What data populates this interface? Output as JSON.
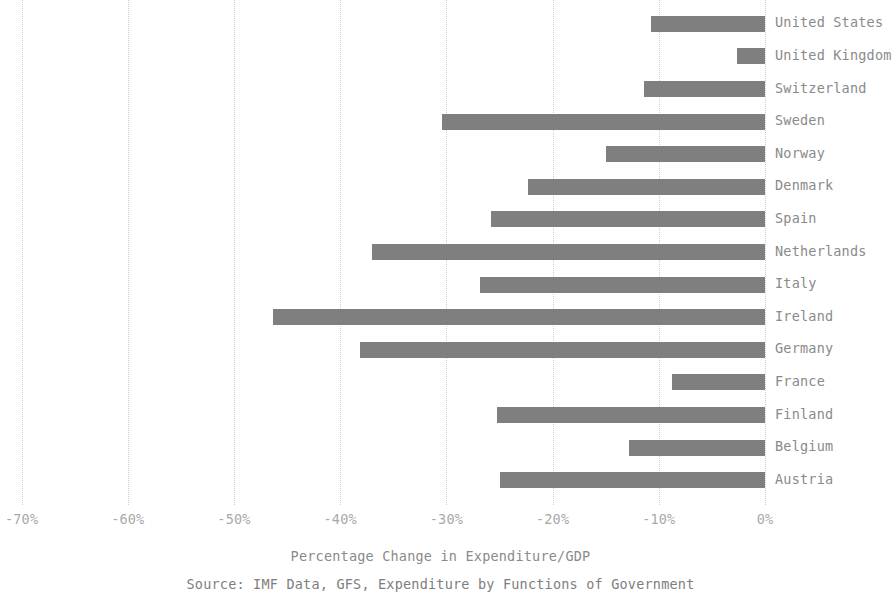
{
  "chart_data": {
    "type": "bar",
    "orientation": "horizontal",
    "title": "",
    "xlabel": "Percentage Change in Expenditure/GDP",
    "ylabel": "",
    "source": "Source: IMF Data, GFS, Expenditure by Functions of Government",
    "xlim": [
      -75,
      2
    ],
    "xticks": [
      -70,
      -60,
      -50,
      -40,
      -30,
      -20,
      -10,
      0
    ],
    "xticklabels": [
      "-70%",
      "-60%",
      "-50%",
      "-40%",
      "-30%",
      "-20%",
      "-10%",
      "0%"
    ],
    "grid": "vertical-dotted",
    "legend": "none",
    "bar_color": "#7f7f7f",
    "categories": [
      "United States",
      "United Kingdom",
      "Switzerland",
      "Sweden",
      "Norway",
      "Denmark",
      "Spain",
      "Netherlands",
      "Italy",
      "Ireland",
      "Germany",
      "France",
      "Finland",
      "Belgium",
      "Austria"
    ],
    "values": [
      -10.7,
      -2.6,
      -11.4,
      -30.4,
      -15.0,
      -22.3,
      -25.8,
      -37.0,
      -26.8,
      -46.3,
      -38.1,
      -8.8,
      -25.2,
      -12.8,
      -25.0
    ]
  }
}
